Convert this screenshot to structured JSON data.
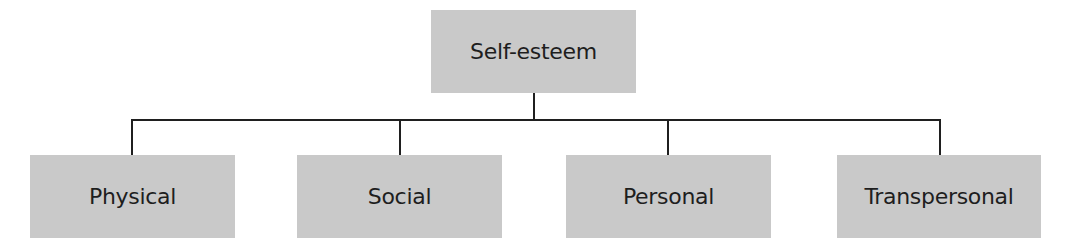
{
  "diagram": {
    "type": "hierarchy",
    "root": {
      "label": "Self-esteem"
    },
    "children": [
      {
        "label": "Physical"
      },
      {
        "label": "Social"
      },
      {
        "label": "Personal"
      },
      {
        "label": "Transpersonal"
      }
    ],
    "colors": {
      "box_fill": "#c9c9c9",
      "line": "#1f1f1f",
      "text": "#1e1e1e",
      "background": "#ffffff"
    }
  }
}
